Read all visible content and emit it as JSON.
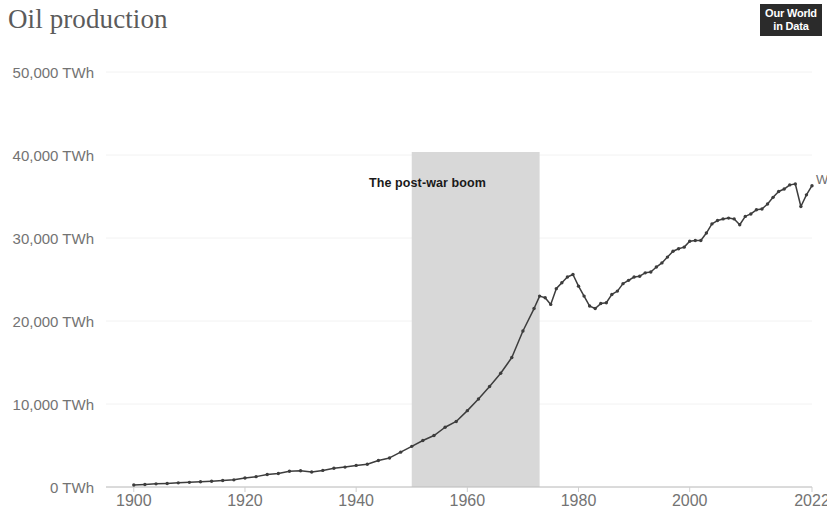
{
  "header": {
    "title": "Oil production",
    "logo": {
      "line1": "Our World",
      "line2": "in Data",
      "name": "our-world-in-data-logo"
    }
  },
  "colors": {
    "line": "#3d3d3d",
    "axis_text": "#737373",
    "title_text": "#5b5b5b",
    "gridline": "#f2f2f2",
    "shaded_region": "#d8d8d8",
    "logo_background": "#2b2b2b"
  },
  "series_label": "World",
  "annotation": {
    "text": "The post-war boom",
    "start_year": 1950,
    "end_year": 1973
  },
  "chart_data": {
    "type": "line",
    "title": "Oil production",
    "xlabel": "",
    "ylabel": "",
    "unit": "TWh",
    "grid": true,
    "legend_position": "line-end-right",
    "xlim": [
      1895,
      2022
    ],
    "ylim": [
      0,
      55000
    ],
    "yticks": [
      0,
      10000,
      20000,
      30000,
      40000,
      50000
    ],
    "ytick_labels": [
      "0 TWh",
      "10,000 TWh",
      "20,000 TWh",
      "30,000 TWh",
      "40,000 TWh",
      "50,000 TWh"
    ],
    "xticks": [
      1900,
      1920,
      1940,
      1960,
      1980,
      2000,
      2022
    ],
    "xtick_labels": [
      "1900",
      "1920",
      "1940",
      "1960",
      "1980",
      "2000",
      "2022"
    ],
    "series": [
      {
        "name": "World",
        "color": "#3d3d3d",
        "x": [
          1900,
          1902,
          1904,
          1906,
          1908,
          1910,
          1912,
          1914,
          1916,
          1918,
          1920,
          1922,
          1924,
          1926,
          1928,
          1930,
          1932,
          1934,
          1936,
          1938,
          1940,
          1942,
          1944,
          1946,
          1948,
          1950,
          1952,
          1954,
          1956,
          1958,
          1960,
          1962,
          1964,
          1966,
          1968,
          1970,
          1972,
          1973,
          1974,
          1975,
          1976,
          1977,
          1978,
          1979,
          1980,
          1981,
          1982,
          1983,
          1984,
          1985,
          1986,
          1987,
          1988,
          1989,
          1990,
          1991,
          1992,
          1993,
          1994,
          1995,
          1996,
          1997,
          1998,
          1999,
          2000,
          2001,
          2002,
          2003,
          2004,
          2005,
          2006,
          2007,
          2008,
          2009,
          2010,
          2011,
          2012,
          2013,
          2014,
          2015,
          2016,
          2017,
          2018,
          2019,
          2020,
          2021,
          2022
        ],
        "y": [
          250,
          300,
          380,
          430,
          500,
          560,
          640,
          700,
          780,
          860,
          1080,
          1250,
          1500,
          1620,
          1900,
          1950,
          1800,
          2000,
          2250,
          2400,
          2600,
          2750,
          3200,
          3500,
          4200,
          4900,
          5600,
          6200,
          7200,
          7900,
          9200,
          10600,
          12100,
          13700,
          15600,
          18800,
          21500,
          23000,
          22800,
          22000,
          23900,
          24600,
          25300,
          25600,
          24200,
          23000,
          21800,
          21500,
          22100,
          22200,
          23200,
          23600,
          24500,
          24900,
          25300,
          25400,
          25800,
          25900,
          26500,
          27000,
          27700,
          28400,
          28700,
          28900,
          29600,
          29700,
          29700,
          30600,
          31700,
          32100,
          32300,
          32400,
          32300,
          31600,
          32600,
          32900,
          33400,
          33500,
          34100,
          34900,
          35600,
          35900,
          36400,
          36500,
          33800,
          35200,
          36300
        ],
        "note": "Values in TWh; y-axis tick spacing 10,000 TWh"
      }
    ],
    "annotations": [
      {
        "type": "shaded_band",
        "label": "The post-war boom",
        "x_start": 1950,
        "x_end": 1973,
        "color": "#d8d8d8"
      }
    ]
  }
}
